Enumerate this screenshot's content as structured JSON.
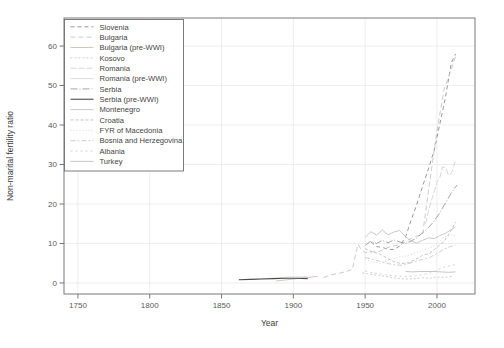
{
  "figure": {
    "background": "#ffffff",
    "frame_color": "#787878",
    "grid_color": "#e9e9e9",
    "tick_text_color": "#5a5a5a"
  },
  "chart_data": {
    "type": "line",
    "title": "",
    "xlabel": "Year",
    "ylabel": "Non-marital fertility ratio",
    "x_ticks": [
      1750,
      1800,
      1850,
      1900,
      1950,
      2000
    ],
    "y_ticks": [
      0,
      10,
      20,
      30,
      40,
      50,
      60
    ],
    "xlim": [
      1740.3,
      2026.5
    ],
    "ylim": [
      -2.8,
      67.1
    ],
    "grid": true,
    "legend_position": "topleft",
    "series": [
      {
        "name": "Slovenia",
        "color": "#8c8c8c",
        "dash": "4 3",
        "width": 0.9,
        "points": [
          [
            1954,
            10.4
          ],
          [
            1958,
            9.2
          ],
          [
            1962,
            9.0
          ],
          [
            1966,
            8.5
          ],
          [
            1970,
            8.5
          ],
          [
            1974,
            9.3
          ],
          [
            1978,
            11.5
          ],
          [
            1982,
            15.9
          ],
          [
            1986,
            19.9
          ],
          [
            1990,
            24.5
          ],
          [
            1994,
            28.8
          ],
          [
            1998,
            33.5
          ],
          [
            2002,
            40.2
          ],
          [
            2006,
            47.2
          ],
          [
            2010,
            55.7
          ],
          [
            2013,
            58.0
          ]
        ]
      },
      {
        "name": "Bulgaria",
        "color": "#c4c4c4",
        "dash": "5 3",
        "width": 0.9,
        "points": [
          [
            1921,
            1.4
          ],
          [
            1926,
            2.0
          ],
          [
            1931,
            2.4
          ],
          [
            1936,
            2.8
          ],
          [
            1941,
            3.4
          ],
          [
            1945,
            9.8
          ],
          [
            1947,
            8.6
          ],
          [
            1950,
            7.7
          ],
          [
            1955,
            7.9
          ],
          [
            1960,
            8.0
          ],
          [
            1965,
            8.9
          ],
          [
            1970,
            9.4
          ],
          [
            1975,
            9.7
          ],
          [
            1980,
            10.9
          ],
          [
            1985,
            11.7
          ],
          [
            1990,
            12.4
          ],
          [
            1995,
            25.7
          ],
          [
            2000,
            38.4
          ],
          [
            2005,
            49.0
          ],
          [
            2010,
            54.1
          ],
          [
            2013,
            57.4
          ]
        ]
      },
      {
        "name": "Bulgaria (pre-WWI)",
        "color": "#cbc2b2",
        "dash": "",
        "width": 0.9,
        "points": [
          [
            1888,
            0.5
          ],
          [
            1893,
            0.7
          ],
          [
            1898,
            0.9
          ],
          [
            1903,
            1.1
          ],
          [
            1908,
            1.3
          ],
          [
            1913,
            1.5
          ],
          [
            1917,
            1.7
          ]
        ]
      },
      {
        "name": "Kosovo",
        "color": "#c8c8c8",
        "dash": "2 2",
        "width": 0.9,
        "points": [
          [
            1948,
            2.6
          ],
          [
            1955,
            2.1
          ],
          [
            1960,
            1.9
          ],
          [
            1965,
            1.6
          ],
          [
            1970,
            1.3
          ],
          [
            1975,
            1.1
          ],
          [
            1980,
            1.0
          ],
          [
            1985,
            1.1
          ],
          [
            1990,
            1.3
          ],
          [
            1995,
            1.2
          ],
          [
            2000,
            1.5
          ],
          [
            2005,
            1.4
          ],
          [
            2011,
            1.7
          ]
        ]
      },
      {
        "name": "Romania",
        "color": "#d3d3d3",
        "dash": "6 2",
        "width": 0.9,
        "points": [
          [
            1992,
            15.0
          ],
          [
            1994,
            18.0
          ],
          [
            1996,
            20.7
          ],
          [
            1998,
            23.0
          ],
          [
            2000,
            25.5
          ],
          [
            2002,
            26.7
          ],
          [
            2004,
            29.4
          ],
          [
            2006,
            29.2
          ],
          [
            2008,
            27.4
          ],
          [
            2010,
            27.7
          ],
          [
            2013,
            31.0
          ]
        ]
      },
      {
        "name": "Romania (pre-WWI)",
        "color": "#dadada",
        "dash": "",
        "width": 0.9,
        "points": [
          [
            1870,
            0.9
          ],
          [
            1880,
            1.1
          ],
          [
            1890,
            1.3
          ],
          [
            1900,
            1.5
          ],
          [
            1910,
            1.6
          ]
        ]
      },
      {
        "name": "Serbia",
        "color": "#9c9c9c",
        "dash": "7 2 1 2",
        "width": 0.9,
        "points": [
          [
            1950,
            9.5
          ],
          [
            1954,
            10.6
          ],
          [
            1958,
            10.0
          ],
          [
            1962,
            10.8
          ],
          [
            1966,
            10.2
          ],
          [
            1970,
            10.9
          ],
          [
            1974,
            10.4
          ],
          [
            1978,
            10.0
          ],
          [
            1982,
            10.6
          ],
          [
            1986,
            11.4
          ],
          [
            1990,
            12.7
          ],
          [
            1994,
            14.0
          ],
          [
            1998,
            15.6
          ],
          [
            2002,
            17.8
          ],
          [
            2006,
            20.3
          ],
          [
            2010,
            22.8
          ],
          [
            2014,
            24.8
          ]
        ]
      },
      {
        "name": "Serbia (pre-WWI)",
        "color": "#4d4d4d",
        "dash": "",
        "width": 1.1,
        "points": [
          [
            1862,
            0.8
          ],
          [
            1870,
            0.9
          ],
          [
            1878,
            1.0
          ],
          [
            1886,
            1.1
          ],
          [
            1894,
            1.2
          ],
          [
            1902,
            1.2
          ],
          [
            1910,
            1.1
          ]
        ]
      },
      {
        "name": "Montenegro",
        "color": "#c2c2c2",
        "dash": "",
        "width": 0.9,
        "points": [
          [
            1950,
            11.5
          ],
          [
            1954,
            13.0
          ],
          [
            1958,
            12.1
          ],
          [
            1962,
            13.4
          ],
          [
            1966,
            12.2
          ],
          [
            1970,
            12.9
          ],
          [
            1974,
            13.3
          ],
          [
            1978,
            11.8
          ],
          [
            1982,
            10.6
          ],
          [
            1986,
            10.1
          ],
          [
            1990,
            10.8
          ],
          [
            1994,
            11.4
          ],
          [
            1998,
            11.2
          ],
          [
            2002,
            12.0
          ],
          [
            2006,
            12.6
          ],
          [
            2010,
            13.5
          ],
          [
            2013,
            14.2
          ]
        ]
      },
      {
        "name": "Croatia",
        "color": "#bcbcbc",
        "dash": "3 2",
        "width": 0.9,
        "points": [
          [
            1950,
            8.7
          ],
          [
            1955,
            7.8
          ],
          [
            1960,
            7.4
          ],
          [
            1965,
            6.3
          ],
          [
            1970,
            5.4
          ],
          [
            1975,
            4.9
          ],
          [
            1980,
            5.1
          ],
          [
            1985,
            5.9
          ],
          [
            1990,
            7.0
          ],
          [
            1995,
            7.5
          ],
          [
            2000,
            9.0
          ],
          [
            2005,
            10.5
          ],
          [
            2010,
            13.3
          ],
          [
            2013,
            15.4
          ]
        ]
      },
      {
        "name": "FYR of Macedonia",
        "color": "#d0d0d0",
        "dash": "1 2",
        "width": 0.9,
        "points": [
          [
            1950,
            6.1
          ],
          [
            1955,
            5.4
          ],
          [
            1960,
            5.0
          ],
          [
            1965,
            5.6
          ],
          [
            1970,
            6.3
          ],
          [
            1975,
            6.7
          ],
          [
            1980,
            6.9
          ],
          [
            1985,
            7.6
          ],
          [
            1990,
            8.2
          ],
          [
            1995,
            8.9
          ],
          [
            2000,
            9.8
          ],
          [
            2005,
            11.6
          ],
          [
            2010,
            12.2
          ],
          [
            2013,
            11.9
          ]
        ]
      },
      {
        "name": "Bosnia and Herzegovina",
        "color": "#c9c9c9",
        "dash": "5 2 2 2",
        "width": 0.9,
        "points": [
          [
            1950,
            6.5
          ],
          [
            1955,
            6.0
          ],
          [
            1960,
            5.5
          ],
          [
            1965,
            5.0
          ],
          [
            1970,
            4.6
          ],
          [
            1975,
            4.5
          ],
          [
            1980,
            4.9
          ],
          [
            1985,
            5.4
          ],
          [
            1990,
            6.0
          ],
          [
            1995,
            6.5
          ],
          [
            2000,
            7.4
          ],
          [
            2005,
            8.6
          ],
          [
            2010,
            9.3
          ],
          [
            2013,
            9.6
          ]
        ]
      },
      {
        "name": "Albania",
        "color": "#cdcdcd",
        "dash": "2 3",
        "width": 0.9,
        "points": [
          [
            1950,
            3.0
          ],
          [
            1955,
            2.6
          ],
          [
            1960,
            2.3
          ],
          [
            1965,
            2.0
          ],
          [
            1970,
            1.8
          ],
          [
            1975,
            1.7
          ],
          [
            1980,
            1.6
          ],
          [
            1985,
            1.8
          ],
          [
            1990,
            2.1
          ],
          [
            1995,
            2.5
          ],
          [
            2000,
            3.2
          ],
          [
            2005,
            4.1
          ],
          [
            2010,
            4.4
          ],
          [
            2013,
            4.7
          ]
        ]
      },
      {
        "name": "Turkey",
        "color": "#c0c0c0",
        "dash": "",
        "width": 0.9,
        "points": [
          [
            1978,
            2.9
          ],
          [
            1983,
            2.8
          ],
          [
            1988,
            2.9
          ],
          [
            1993,
            2.9
          ],
          [
            1998,
            2.9
          ],
          [
            2003,
            2.8
          ],
          [
            2008,
            2.7
          ],
          [
            2013,
            2.8
          ]
        ]
      }
    ]
  }
}
